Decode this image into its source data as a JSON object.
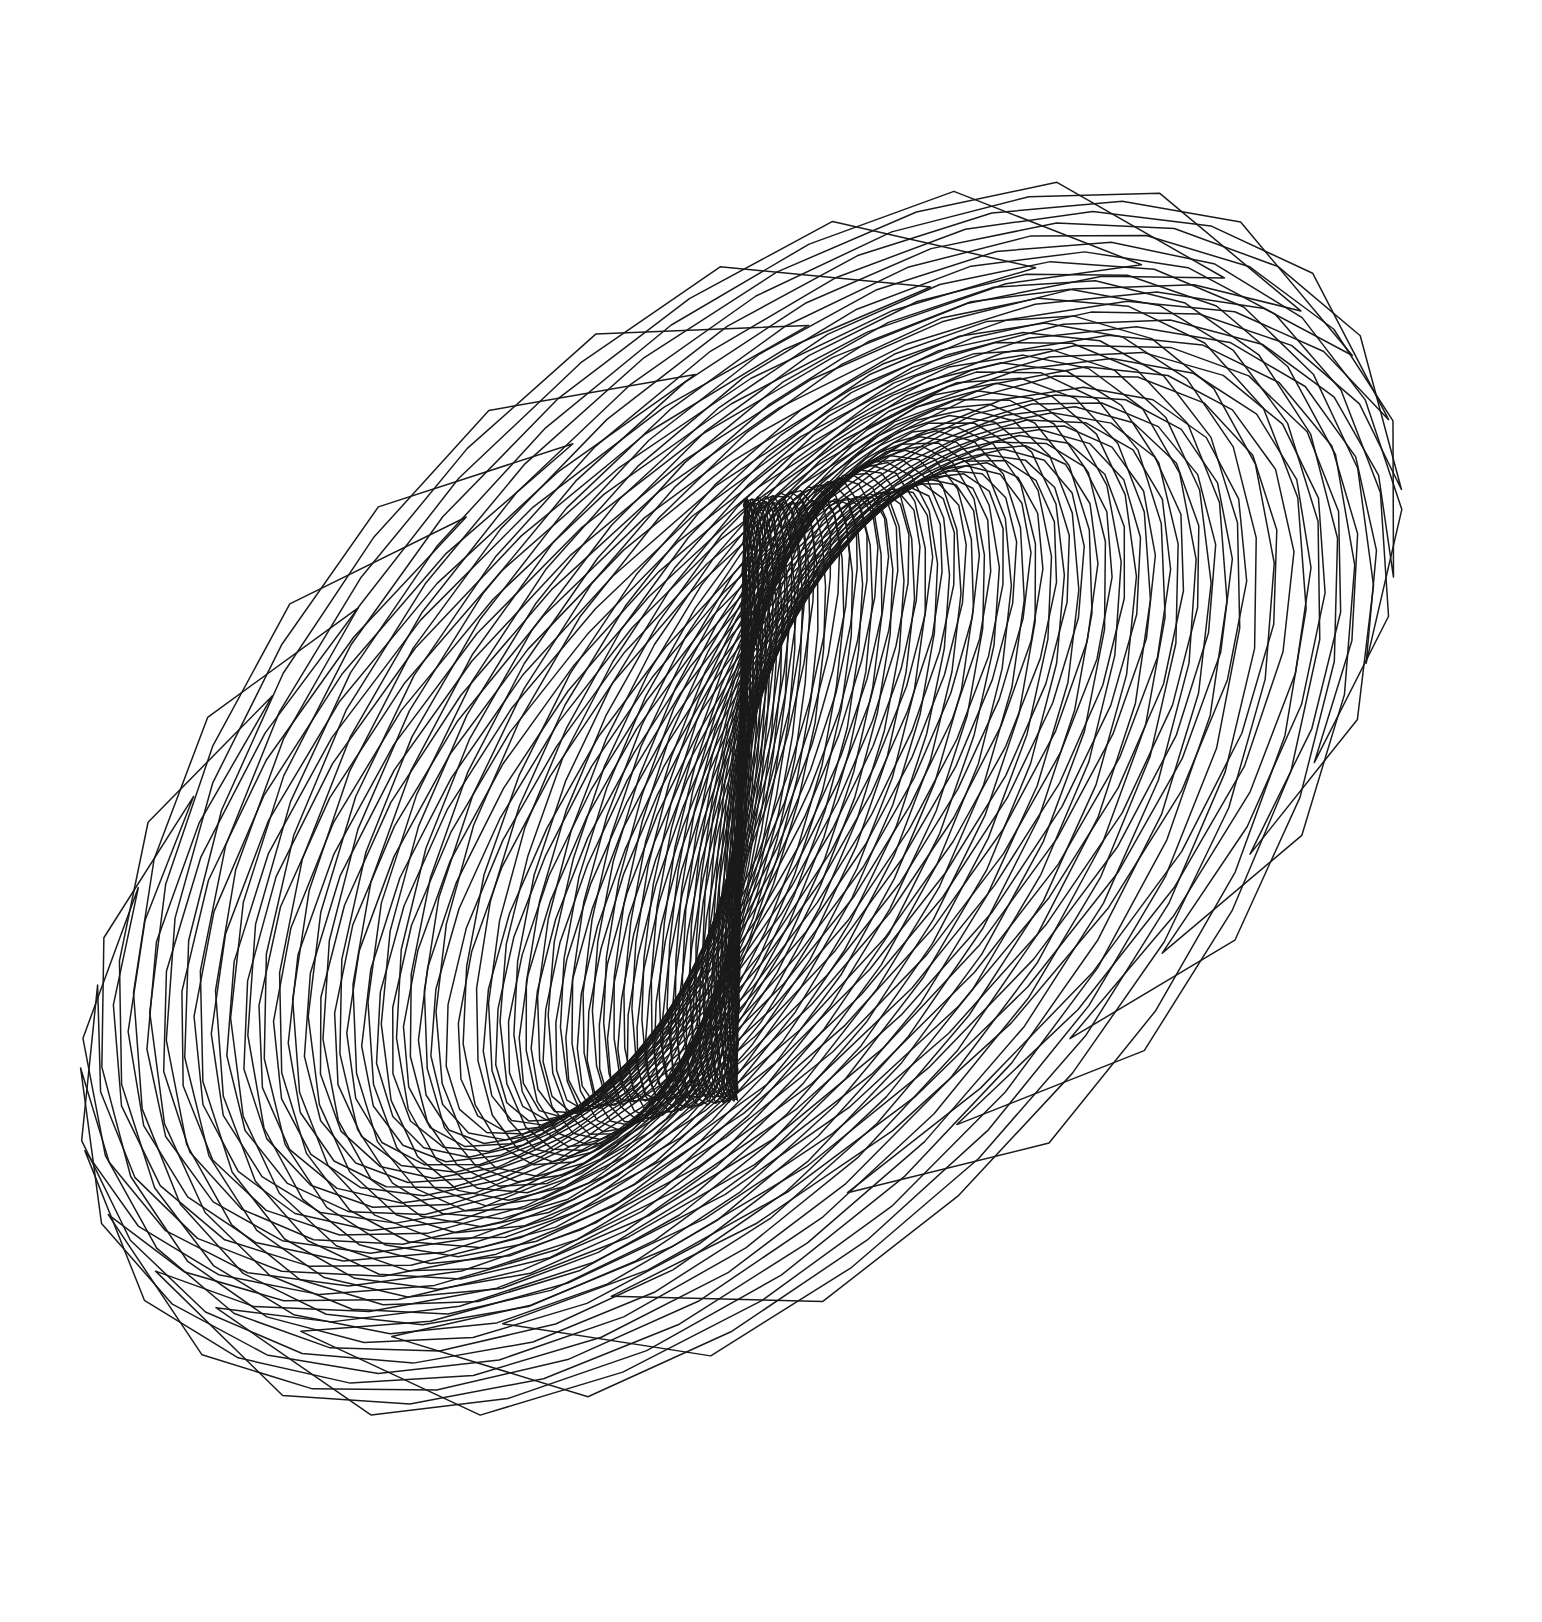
{
  "artwork": {
    "title": "Spiral Rosette",
    "type": "generative-line-art",
    "medium": "pen-and-ink line drawing",
    "subject": "nested spiralling quadrilateral blades radiating from a twin-node center",
    "background_color": "#ffffff",
    "stroke_color": "#1a1a1a",
    "stroke_width": 1.5,
    "canvas": {
      "width": 1542,
      "height": 1622
    }
  },
  "geometry": {
    "center": {
      "x": 742,
      "y": 800
    },
    "node_upper": {
      "x": 728,
      "y": 500
    },
    "node_lower": {
      "x": 753,
      "y": 1100
    },
    "node_offset_y": 300,
    "blade_count": 34,
    "turns": 1.62,
    "start_angle_deg": -96,
    "angle_step_deg": 20.6,
    "radius_inner": 16,
    "radius_outer": 716,
    "radius_growth": 1.0925,
    "ellipse_ratio_x": 1.0,
    "ellipse_ratio_y": 0.735,
    "blade_half_width_deg": 9.2,
    "blade_taper": 0.46,
    "cap_inset": 0.055,
    "samples_per_blade": 46,
    "extent": {
      "left": 35,
      "right": 1445,
      "top": 90,
      "bottom": 1530
    }
  },
  "rendering": {
    "fill": "none",
    "line_cap": "round",
    "line_join": "round",
    "jitter_amplitude": 1.15,
    "jitter_seed": 20947
  }
}
